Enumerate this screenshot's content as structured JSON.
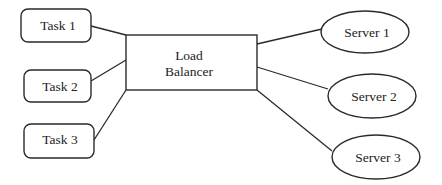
{
  "diagram": {
    "type": "load-balancer-architecture",
    "tasks": [
      {
        "label": "Task 1"
      },
      {
        "label": "Task 2"
      },
      {
        "label": "Task 3"
      }
    ],
    "balancer": {
      "line1": "Load",
      "line2": "Balancer"
    },
    "servers": [
      {
        "label": "Server 1"
      },
      {
        "label": "Server 2"
      },
      {
        "label": "Server 3"
      }
    ],
    "edges": [
      {
        "from": "Task 1",
        "to": "Load Balancer"
      },
      {
        "from": "Task 2",
        "to": "Load Balancer"
      },
      {
        "from": "Task 3",
        "to": "Load Balancer"
      },
      {
        "from": "Load Balancer",
        "to": "Server 1"
      },
      {
        "from": "Load Balancer",
        "to": "Server 2"
      },
      {
        "from": "Load Balancer",
        "to": "Server 3"
      }
    ]
  }
}
